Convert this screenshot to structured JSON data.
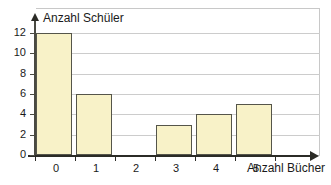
{
  "chart_data": {
    "type": "bar",
    "title": "",
    "subtitle": "",
    "xlabel": "Anzahl Bücher",
    "ylabel": "Anzahl Schüler",
    "categories": [
      "0",
      "1",
      "2",
      "3",
      "4",
      "5"
    ],
    "values": [
      12,
      6,
      0,
      3,
      4,
      5
    ],
    "series": [
      {
        "name": "Anzahl Schüler",
        "values": [
          12,
          6,
          0,
          3,
          4,
          5
        ]
      }
    ],
    "xlim": [
      0,
      6
    ],
    "ylim": [
      0,
      12
    ],
    "y_ticks": [
      0,
      2,
      4,
      6,
      8,
      10,
      12
    ],
    "y_tick_labels": [
      "0",
      "2",
      "4",
      "6",
      "8",
      "10",
      "12"
    ],
    "x_tick_labels": [
      "0",
      "1",
      "2",
      "3",
      "4",
      "5"
    ],
    "grid": "horizontal",
    "legend": "none",
    "bar_fill_color": "#f8f2c8",
    "bar_stroke_color": "#55554a",
    "gridline_color": "#cccccc",
    "axis_color": "#2b2b26",
    "text_color": "#1a1a1a",
    "background_color": "#ffffff"
  },
  "axes": {
    "y_title": "Anzahl Schüler",
    "x_title": "Anzahl Bücher"
  }
}
